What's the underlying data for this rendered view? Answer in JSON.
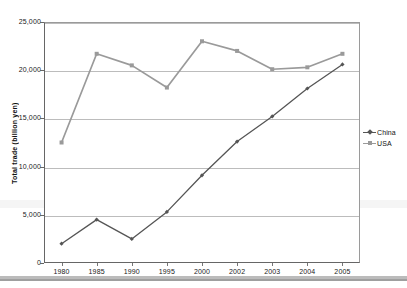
{
  "chart_data": {
    "type": "line",
    "title": "",
    "xlabel": "",
    "ylabel": "Total trade (billion yen)",
    "categories": [
      "1980",
      "1985",
      "1990",
      "1995",
      "2000",
      "2002",
      "2003",
      "2004",
      "2005"
    ],
    "ylim": [
      0,
      25000
    ],
    "ytick_values": [
      0,
      5000,
      10000,
      15000,
      20000,
      25000
    ],
    "ytick_labels": [
      "0",
      "5,000",
      "10,000",
      "15,000",
      "20,000",
      "25,000"
    ],
    "grid": true,
    "legend_position": "right",
    "series": [
      {
        "name": "China",
        "color": "#555555",
        "marker": "diamond",
        "values": [
          2000,
          4500,
          2500,
          5300,
          9100,
          12600,
          15200,
          18100,
          20600
        ]
      },
      {
        "name": "USA",
        "color": "#9a9a9a",
        "marker": "square",
        "values": [
          12500,
          21700,
          20500,
          18200,
          23000,
          22000,
          20100,
          20300,
          21700
        ]
      }
    ]
  },
  "legend": {
    "items": [
      {
        "label": "China",
        "color": "#555555"
      },
      {
        "label": "USA",
        "color": "#9a9a9a"
      }
    ]
  },
  "axes": {
    "y_title": "Total trade (billion yen)"
  }
}
